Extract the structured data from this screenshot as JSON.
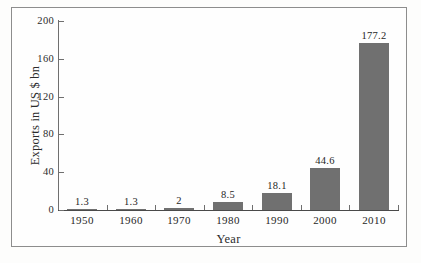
{
  "chart_data": {
    "type": "bar",
    "title": "",
    "xlabel": "Year",
    "ylabel": "Exports in US $ bn",
    "categories": [
      "1950",
      "1960",
      "1970",
      "1980",
      "1990",
      "2000",
      "2010"
    ],
    "values": [
      1.3,
      1.3,
      2,
      8.5,
      18.1,
      44.6,
      177.2
    ],
    "value_labels": [
      "1.3",
      "1.3",
      "2",
      "8.5",
      "18.1",
      "44.6",
      "177.2"
    ],
    "ylim": [
      0,
      200
    ],
    "yticks": [
      0,
      40,
      80,
      120,
      160,
      200
    ],
    "ytick_labels": [
      "0",
      "40",
      "80",
      "120",
      "160",
      "200"
    ],
    "grid": false,
    "legend": false,
    "bar_color": "#707070",
    "axis_color": "#6f6f6f",
    "frame_color": "#8d8d8d",
    "background": "#fefefe"
  },
  "caption": {
    "clipped_text": ""
  }
}
